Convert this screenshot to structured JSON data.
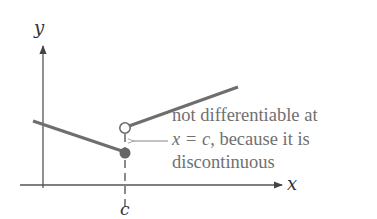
{
  "figure": {
    "axes": {
      "x_label": "x",
      "y_label": "y",
      "tick_label": "c"
    },
    "annotation": {
      "line1": "not differentiable at",
      "line2_math": "x = c",
      "line2_rest": ", because it is",
      "line3": "discontinuous"
    },
    "colors": {
      "axis": "#555555",
      "curve": "#6e6e6e",
      "filled_dot": "#666666",
      "open_dot_stroke": "#6e6e6e",
      "text": "#707070"
    }
  }
}
